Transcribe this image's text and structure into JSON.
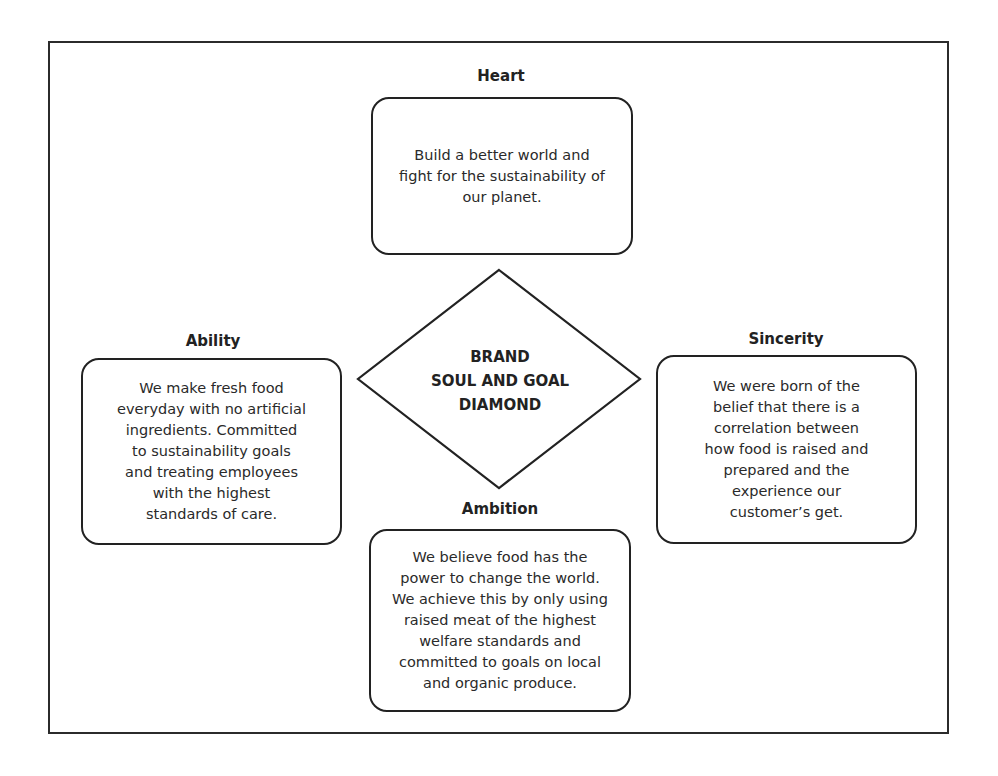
{
  "diagram": {
    "center": {
      "title": "BRAND\nSOUL AND GOAL\nDIAMOND"
    },
    "nodes": [
      {
        "id": "heart",
        "label": "Heart",
        "text": "Build a better world and\nfight for the sustainability of\nour planet."
      },
      {
        "id": "ability",
        "label": "Ability",
        "text": "We make fresh food\neveryday with no artificial\ningredients. Committed\nto sustainability goals\nand treating employees\nwith the highest\nstandards of care."
      },
      {
        "id": "sincerity",
        "label": "Sincerity",
        "text": "We were born of the\nbelief that there is a\ncorrelation between\nhow  food is raised and\nprepared and  the\nexperience our\ncustomer’s get."
      },
      {
        "id": "ambition",
        "label": "Ambition",
        "text": "We believe food has the\npower to change the world.\nWe achieve this by only using\nraised meat of the highest\nwelfare standards and\ncommitted to goals on local\nand organic produce."
      }
    ],
    "colors": {
      "stroke": "#222222",
      "background": "#ffffff",
      "text": "#2a2a2a"
    }
  }
}
